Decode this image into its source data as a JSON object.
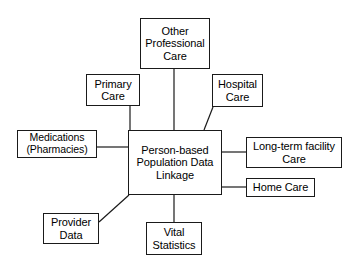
{
  "diagram": {
    "title": "Person-based Population Data Linkage",
    "type": "hub-and-spoke node diagram",
    "style": {
      "background": "#ffffff",
      "box_border": "#1a1a1a",
      "box_fill": "#ffffff",
      "text_color": "#000000",
      "connector_color": "#1a1a1a"
    },
    "center": {
      "id": "central",
      "label": "Person-based\nPopulation Data\nLinkage",
      "x": 128,
      "y": 130,
      "w": 94,
      "h": 65
    },
    "nodes": [
      {
        "id": "other-professional-care",
        "label": "Other\nProfessional\nCare",
        "x": 140,
        "y": 18,
        "w": 70,
        "h": 51
      },
      {
        "id": "primary-care",
        "label": "Primary\nCare",
        "x": 86,
        "y": 74,
        "w": 54,
        "h": 32
      },
      {
        "id": "hospital-care",
        "label": "Hospital\nCare",
        "x": 212,
        "y": 74,
        "w": 51,
        "h": 33
      },
      {
        "id": "medications",
        "label": "Medications\n(Pharmacies)",
        "x": 17,
        "y": 130,
        "w": 80,
        "h": 28
      },
      {
        "id": "long-term-facility-care",
        "label": "Long-term facility\nCare",
        "x": 246,
        "y": 137,
        "w": 96,
        "h": 31
      },
      {
        "id": "home-care",
        "label": "Home Care",
        "x": 246,
        "y": 178,
        "w": 69,
        "h": 19
      },
      {
        "id": "provider-data",
        "label": "Provider\nData",
        "x": 43,
        "y": 213,
        "w": 56,
        "h": 31
      },
      {
        "id": "vital-statistics",
        "label": "Vital\nStatistics",
        "x": 146,
        "y": 222,
        "w": 56,
        "h": 33
      }
    ],
    "connectors": [
      {
        "id": "connector-other-professional-care",
        "from": "other-professional-care",
        "to": "central",
        "kind": "vertical",
        "x1": 174,
        "y1": 69,
        "x2": 174,
        "y2": 130
      },
      {
        "id": "connector-primary-care",
        "from": "primary-care",
        "to": "central",
        "kind": "vertical",
        "x1": 130,
        "y1": 106,
        "x2": 130,
        "y2": 130
      },
      {
        "id": "connector-hospital-care",
        "from": "hospital-care",
        "to": "central",
        "kind": "diagonal",
        "x1": 213,
        "y1": 107,
        "x2": 204,
        "y2": 130
      },
      {
        "id": "connector-medications",
        "from": "medications",
        "to": "central",
        "kind": "horizontal",
        "x1": 97,
        "y1": 147,
        "x2": 128,
        "y2": 147
      },
      {
        "id": "connector-long-term-facility-care",
        "from": "central",
        "to": "long-term-facility-care",
        "kind": "horizontal",
        "x1": 222,
        "y1": 152,
        "x2": 246,
        "y2": 152
      },
      {
        "id": "connector-home-care",
        "from": "central",
        "to": "home-care",
        "kind": "horizontal",
        "x1": 222,
        "y1": 187,
        "x2": 246,
        "y2": 187
      },
      {
        "id": "connector-provider-data",
        "from": "provider-data",
        "to": "central",
        "kind": "diagonal",
        "x1": 99,
        "y1": 222,
        "x2": 129,
        "y2": 195
      },
      {
        "id": "connector-vital-statistics",
        "from": "central",
        "to": "vital-statistics",
        "kind": "vertical",
        "x1": 174,
        "y1": 195,
        "x2": 174,
        "y2": 222
      }
    ]
  }
}
